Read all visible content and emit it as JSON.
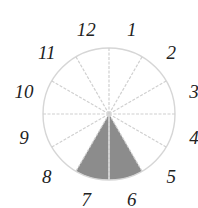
{
  "diagram": {
    "type": "clock-sector-diagram",
    "center": [
      109,
      114
    ],
    "radius": 66,
    "label_radius": 88,
    "sector_count": 12,
    "labels": [
      "12",
      "1",
      "2",
      "3",
      "4",
      "5",
      "6",
      "7",
      "8",
      "9",
      "10",
      "11"
    ],
    "shaded_labels": [
      "6",
      "7"
    ],
    "colors": {
      "circle_stroke": "#d6d6d6",
      "spoke_stroke": "#d0d0d0",
      "shaded_fill": "#8c8c8c",
      "shaded_divider": "#d8d8d8",
      "label_text": "#222222",
      "background": "#ffffff"
    }
  }
}
